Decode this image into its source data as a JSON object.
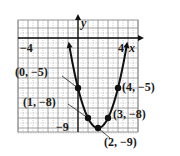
{
  "chart_data": {
    "type": "line",
    "title": "",
    "function": "y = x^2 - 4x - 5",
    "xlabel": "x",
    "ylabel": "y",
    "xlim": [
      -6,
      6
    ],
    "ylim": [
      -9.4,
      1.8
    ],
    "grid": true,
    "tick_labels": {
      "x": [
        {
          "value": -4,
          "label": "−4"
        },
        {
          "value": 4,
          "label": "4"
        }
      ],
      "y": [
        {
          "value": -9,
          "label": "−9"
        }
      ]
    },
    "points": [
      {
        "x": 0,
        "y": -5,
        "label": "(0, −5)"
      },
      {
        "x": 4,
        "y": -5,
        "label": "(4, −5)"
      },
      {
        "x": 1,
        "y": -8,
        "label": "(1, −8)"
      },
      {
        "x": 3,
        "y": -8,
        "label": "(3, −8)"
      },
      {
        "x": 2,
        "y": -9,
        "label": "(2, −9)"
      }
    ],
    "series": [
      {
        "name": "parabola",
        "x": [
          -0.9,
          0,
          1,
          2,
          3,
          4,
          4.9
        ],
        "y": [
          3.4,
          -5,
          -8,
          -9,
          -8,
          -5,
          3.4
        ]
      }
    ],
    "colors": {
      "curve": "#111111",
      "grid": "#8a8a8a",
      "axis": "#111111"
    }
  },
  "labels": {
    "x_axis": "x",
    "y_axis": "y",
    "tick_neg4": "−4",
    "tick_4": "4",
    "tick_neg9": "−9",
    "p_0_neg5": "(0, −5)",
    "p_4_neg5": "(4, −5)",
    "p_1_neg8": "(1, −8)",
    "p_3_neg8": "(3, −8)",
    "p_2_neg9": "(2, −9)"
  }
}
